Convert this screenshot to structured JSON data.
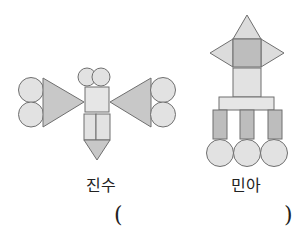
{
  "figures": [
    {
      "name": "진수",
      "description": "butterfly-like figure made of circles, triangles, square and rectangles"
    },
    {
      "name": "민아",
      "description": "rocket/tower-like figure made of triangles, squares, rectangles and circles"
    }
  ],
  "labels": {
    "left": "진수",
    "right": "민아"
  },
  "answer_blank": {
    "open": "(",
    "close": ")"
  },
  "colors": {
    "stroke": "#6f6f6f",
    "circle_fill": "#e2e2e2",
    "triangle_fill": "#c8c8c8",
    "light_fill": "#e6e6e6",
    "dark_fill": "#bdbdbd",
    "light_triangle_fill": "#dcdcdc"
  }
}
